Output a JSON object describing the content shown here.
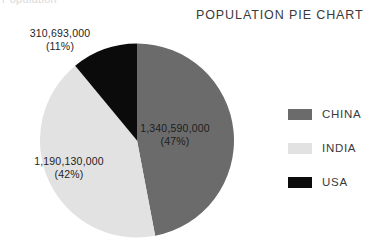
{
  "artifact": {
    "clipped_text": "Population"
  },
  "chart_data": {
    "type": "pie",
    "title": "POPULATION PIE CHART",
    "xlabel": "",
    "ylabel": "",
    "legend_position": "right",
    "grid": false,
    "categories": [
      "CHINA",
      "INDIA",
      "USA"
    ],
    "values": [
      1340590000,
      1190130000,
      310693000
    ],
    "percentages": [
      47,
      42,
      11
    ],
    "colors": [
      "#6b6b6b",
      "#e2e2e2",
      "#0b0b0b"
    ],
    "slices": [
      {
        "name": "CHINA",
        "value": 1340590000,
        "value_label": "1,340,590,000",
        "percent": 47,
        "percent_label": "(47%)",
        "color": "#6b6b6b",
        "start_angle_deg": 0,
        "sweep_angle_deg": 169.2
      },
      {
        "name": "INDIA",
        "value": 1190130000,
        "value_label": "1,190,130,000",
        "percent": 42,
        "percent_label": "(42%)",
        "color": "#e2e2e2",
        "start_angle_deg": 169.2,
        "sweep_angle_deg": 151.2
      },
      {
        "name": "USA",
        "value": 310693000,
        "value_label": "310,693,000",
        "percent": 11,
        "percent_label": "(11%)",
        "color": "#0b0b0b",
        "start_angle_deg": 320.4,
        "sweep_angle_deg": 39.6
      }
    ]
  },
  "legend": {
    "items": [
      {
        "label": "CHINA",
        "color": "#6b6b6b"
      },
      {
        "label": "INDIA",
        "color": "#e2e2e2"
      },
      {
        "label": "USA",
        "color": "#0b0b0b"
      }
    ]
  }
}
